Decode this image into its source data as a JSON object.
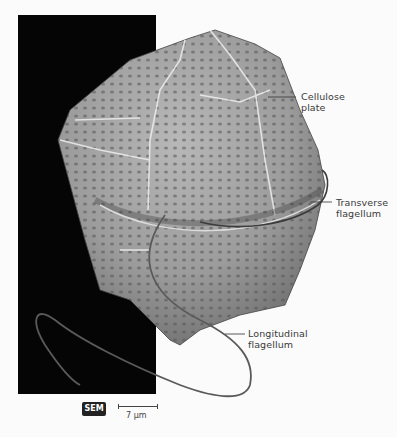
{
  "figure": {
    "labels": {
      "cellulose_plate": [
        "Cellulose",
        "plate"
      ],
      "transverse_flagellum": [
        "Transverse",
        "flagellum"
      ],
      "longitudinal_flagellum": [
        "Longitudinal",
        "flagellum"
      ]
    },
    "badge": "SEM",
    "scale": "7 µm",
    "colors": {
      "background": "#fbfbfb",
      "panel": "#050505",
      "cell": "#9a9a9a",
      "label_text": "#3a3a3a"
    }
  }
}
